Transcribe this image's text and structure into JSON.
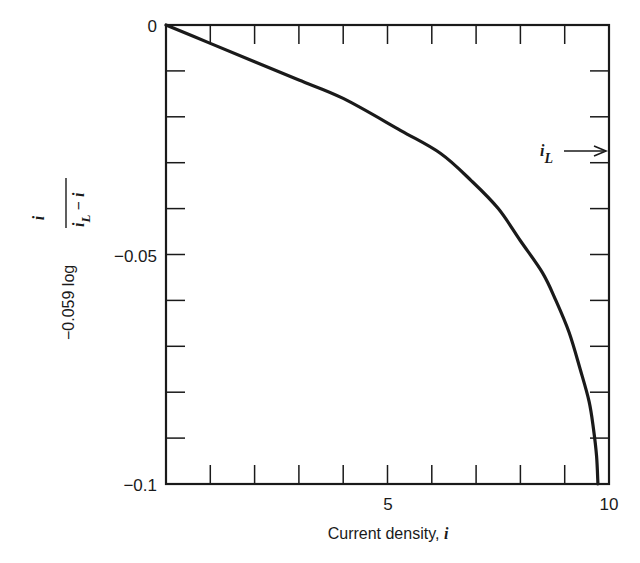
{
  "chart_data": {
    "type": "line",
    "title": "",
    "xlabel": "Current density, i",
    "ylabel": "-0.059 log i/(i_L - i)",
    "xlim": [
      0,
      10
    ],
    "ylim": [
      -0.1,
      0
    ],
    "x_ticks": [
      0,
      1,
      2,
      3,
      4,
      5,
      6,
      7,
      8,
      9,
      10
    ],
    "x_tick_labels": [
      "5",
      "10"
    ],
    "y_ticks": [
      0,
      -0.01,
      -0.02,
      -0.03,
      -0.04,
      -0.05,
      -0.06,
      -0.07,
      -0.08,
      -0.09,
      -0.1
    ],
    "y_tick_labels": [
      "0",
      "-0.05",
      "-0.1"
    ],
    "grid": false,
    "legend": null,
    "series": [
      {
        "name": "overpotential curve",
        "x": [
          0,
          1.0,
          2.0,
          3.0,
          4.0,
          5.3,
          6.2,
          6.9,
          7.5,
          8.0,
          8.5,
          8.8,
          9.1,
          9.35,
          9.55,
          9.65,
          9.72,
          9.75
        ],
        "y": [
          0,
          -0.004,
          -0.008,
          -0.012,
          -0.016,
          -0.023,
          -0.028,
          -0.034,
          -0.04,
          -0.047,
          -0.054,
          -0.06,
          -0.067,
          -0.075,
          -0.082,
          -0.088,
          -0.094,
          -0.1
        ]
      }
    ],
    "annotations": [
      {
        "text": "i_L",
        "type": "arrow",
        "points_to": "right axis",
        "y": -0.027
      }
    ]
  },
  "labels": {
    "y_top": "0",
    "y_mid": "−0.05",
    "y_bottom": "−0.1",
    "x_mid": "5",
    "x_right": "10",
    "xlabel_text": "Current density, ",
    "xlabel_var": "i",
    "ylabel_prefix": "−0.059  log",
    "ylabel_num": "i",
    "ylabel_den_a": "i",
    "ylabel_den_sub": "L",
    "ylabel_den_b": " − i",
    "annot_i": "i",
    "annot_sub": "L"
  }
}
